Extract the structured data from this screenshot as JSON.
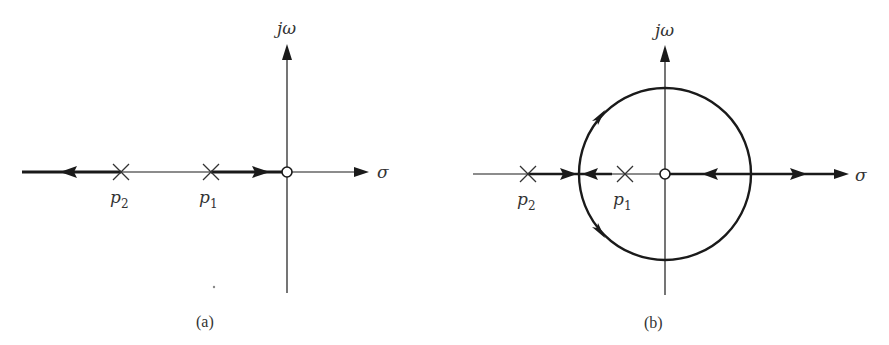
{
  "figure": {
    "panels": [
      {
        "id": "a",
        "caption": "(a)",
        "axes": {
          "horizontal_label": "σ",
          "vertical_label": "jω"
        },
        "poles": [
          {
            "label": "p",
            "subscript": "2"
          },
          {
            "label": "p",
            "subscript": "1"
          }
        ],
        "zero": "origin",
        "description": "Root locus on real axis: from p2 toward -∞ and from p1 toward zero at origin"
      },
      {
        "id": "b",
        "caption": "(b)",
        "axes": {
          "horizontal_label": "σ",
          "vertical_label": "jω"
        },
        "poles": [
          {
            "label": "p",
            "subscript": "2"
          },
          {
            "label": "p",
            "subscript": "1"
          }
        ],
        "zero": "origin",
        "description": "Root locus with breakaway circle centered at zero; branches meet, circle around origin, rejoin real axis right of origin and go to zero and +∞"
      }
    ],
    "colors": {
      "ink": "#1a1a1a",
      "text": "#333333",
      "background": "#ffffff"
    }
  }
}
